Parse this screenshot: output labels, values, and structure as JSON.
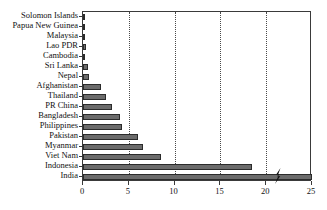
{
  "chart_data": {
    "type": "bar",
    "orientation": "horizontal",
    "title": "",
    "subtitle": "",
    "xlabel": "",
    "ylabel": "",
    "xlim": [
      0,
      25
    ],
    "ylim": null,
    "grid": true,
    "grid_axis": "x",
    "grid_style": "dotted",
    "legend": false,
    "legend_position": "none",
    "axis_break": {
      "present": true,
      "axis": "x",
      "approx_value": 21.5,
      "note": "zigzag break drawn across the India bar"
    },
    "xticks": [
      0,
      5,
      10,
      15,
      20,
      25
    ],
    "xtick_labels": [
      "0",
      "5",
      "10",
      "15",
      "20",
      "25"
    ],
    "categories": [
      "Solomon Islands",
      "Papua New Guinea",
      "Malaysia",
      "Lao PDR",
      "Cambodia",
      "Sri Lanka",
      "Nepal",
      "Afghanistan",
      "Thailand",
      "PR China",
      "Bangladesh",
      "Philippines",
      "Pakistan",
      "Myanmar",
      "Viet Nam",
      "Indonesia",
      "India"
    ],
    "values": [
      0.05,
      0.15,
      0.2,
      0.3,
      0.25,
      0.5,
      0.7,
      2.0,
      2.5,
      3.2,
      4.0,
      4.3,
      6.0,
      6.5,
      8.5,
      18.4,
      25.0
    ],
    "bar_color": "#6B6B6B",
    "bar_edge_color": "#2B2B2B",
    "axis_color": "#3A3A3A",
    "text_color": "#111111",
    "background_color": "#FFFFFF"
  }
}
